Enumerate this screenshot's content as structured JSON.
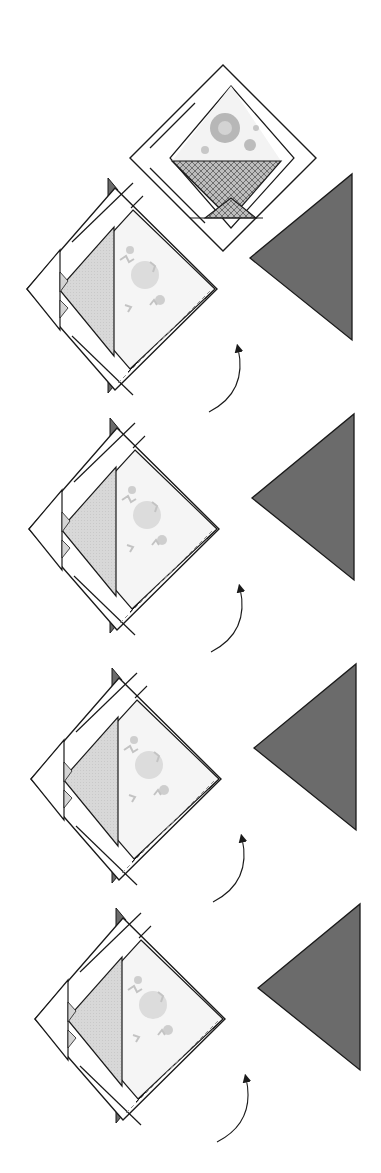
{
  "diagram": {
    "type": "quilt-block-assembly",
    "text_labels": [],
    "colors": {
      "background": "#ffffff",
      "outline": "#1a1a1a",
      "dark_triangle": "#6b6b6b",
      "light_triangle": "#d9d9d9",
      "crosshatch_fill": "#a8a8a8",
      "floral_base": "#f4f4f4",
      "floral_motif": "#b5b5b5"
    },
    "finished_block": {
      "label": "",
      "description": "Finished basket block set on point with border strips"
    },
    "steps": [
      {
        "index": 1,
        "y_offset": 0
      },
      {
        "index": 2,
        "y_offset": 240
      },
      {
        "index": 3,
        "y_offset": 490
      },
      {
        "index": 4,
        "y_offset": 730
      }
    ]
  }
}
